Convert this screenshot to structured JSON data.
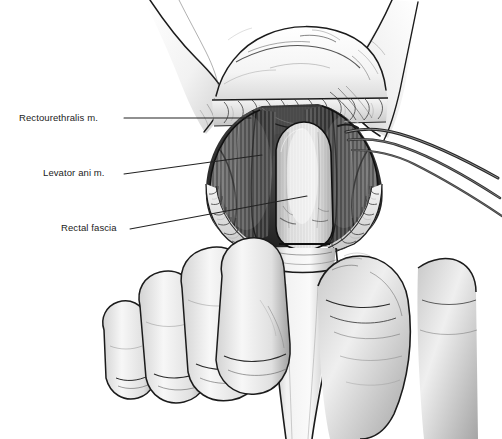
{
  "figure": {
    "kind": "medical-surgical-illustration",
    "style": "grayscale pen-and-ink with airbrush shading",
    "width": 502,
    "height": 439,
    "background_color": "#ffffff"
  },
  "palette": {
    "background": "#ffffff",
    "ink": "#1b1b1b",
    "leader_line": "#222222",
    "skin_light": "#fbfbfb",
    "skin_mid": "#d8d8d8",
    "skin_shadow": "#9a9a9a",
    "fat_light": "#ededed",
    "fat_outline": "#3a3a3a",
    "muscle_dark": "#3c3c3c",
    "muscle_mid": "#6d6d6d",
    "muscle_light": "#a8a8a8",
    "fascia_light": "#e6e6e6",
    "fascia_mid": "#bdbdbd",
    "instrument": "#4a4a4a",
    "wound_deep": "#2a2a2a"
  },
  "labels": [
    {
      "id": "rectourethralis",
      "text": "Rectourethralis m.",
      "text_x": 19,
      "text_y": 113,
      "leader": {
        "x1": 124,
        "y1": 118,
        "x2": 251,
        "y2": 118
      }
    },
    {
      "id": "levator-ani",
      "text": "Levator ani m.",
      "text_x": 43,
      "text_y": 168,
      "leader": {
        "x1": 124,
        "y1": 174,
        "x2": 262,
        "y2": 155
      }
    },
    {
      "id": "rectal-fascia",
      "text": "Rectal fascia",
      "text_x": 61,
      "text_y": 223,
      "leader": {
        "x1": 130,
        "y1": 229,
        "x2": 307,
        "y2": 196
      }
    }
  ],
  "anatomy": [
    {
      "id": "left-thigh",
      "name": "Left thigh / buttock",
      "region": "upper-left"
    },
    {
      "id": "right-thigh",
      "name": "Right thigh / buttock",
      "region": "upper-right"
    },
    {
      "id": "scrotum-perineum",
      "name": "Scrotum and perineal skin",
      "region": "top-center"
    },
    {
      "id": "subcutaneous-fat",
      "name": "Subcutaneous fat at wound edge",
      "region": "wound-margin"
    },
    {
      "id": "rectourethralis-m",
      "name": "Rectourethralis muscle",
      "region": "deep-superior"
    },
    {
      "id": "levator-ani-m",
      "name": "Levator ani muscle",
      "region": "lateral-walls"
    },
    {
      "id": "rectal-fascia-s",
      "name": "Rectal fascia",
      "region": "central-oval"
    },
    {
      "id": "rectum-stump",
      "name": "Mobilized rectum / anal canal",
      "region": "bottom-center"
    },
    {
      "id": "surgeons-hand",
      "name": "Surgeon's gloved hand",
      "region": "bottom"
    },
    {
      "id": "retractor",
      "name": "Surgical retractor / forceps",
      "region": "right"
    }
  ]
}
